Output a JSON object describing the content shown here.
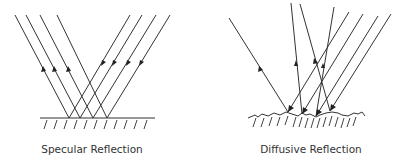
{
  "diagrams": [
    {
      "id": "specular",
      "caption": "Specular Reflection",
      "surface": "smooth"
    },
    {
      "id": "diffusive",
      "caption": "Diffusive Reflection",
      "surface": "rough"
    }
  ],
  "colors": {
    "line": "#333333",
    "background": "#ffffff"
  }
}
